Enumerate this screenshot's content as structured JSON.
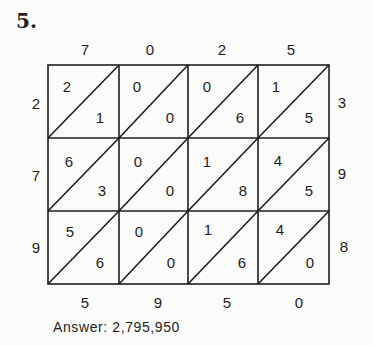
{
  "problem_number": "5.",
  "top_digits": [
    "7",
    "0",
    "2",
    "5"
  ],
  "left_digits": [
    "2",
    "7",
    "9"
  ],
  "right_digits": [
    "3",
    "9",
    "8"
  ],
  "bottom_digits": [
    "5",
    "9",
    "5",
    "0"
  ],
  "cells": [
    [
      {
        "tens": "2",
        "ones": "1"
      },
      {
        "tens": "0",
        "ones": "0"
      },
      {
        "tens": "0",
        "ones": "6"
      },
      {
        "tens": "1",
        "ones": "5"
      }
    ],
    [
      {
        "tens": "6",
        "ones": "3"
      },
      {
        "tens": "0",
        "ones": "0"
      },
      {
        "tens": "1",
        "ones": "8"
      },
      {
        "tens": "4",
        "ones": "5"
      }
    ],
    [
      {
        "tens": "5",
        "ones": "6"
      },
      {
        "tens": "0",
        "ones": "0"
      },
      {
        "tens": "1",
        "ones": "6"
      },
      {
        "tens": "4",
        "ones": "0"
      }
    ]
  ],
  "answer": "Answer: 2,795,950"
}
